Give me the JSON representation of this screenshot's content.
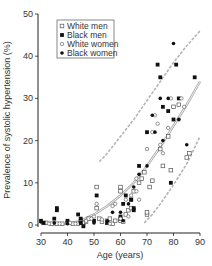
{
  "chart_data": {
    "type": "scatter",
    "title": "",
    "xlabel": "Age (years)",
    "ylabel": "Prevalence of systolic hypertension (%)",
    "xlim": [
      30,
      90
    ],
    "ylim": [
      0,
      50
    ],
    "xticks": [
      30,
      40,
      50,
      60,
      70,
      80,
      90
    ],
    "yticks": [
      0,
      10,
      20,
      30,
      40,
      50
    ],
    "grid": false,
    "legend_position": "upper-left",
    "series": [
      {
        "name": "White men",
        "marker": "open-square",
        "points": [
          [
            31,
            0.5
          ],
          [
            32,
            0.5
          ],
          [
            34,
            0.3
          ],
          [
            36,
            0.3
          ],
          [
            38,
            0.3
          ],
          [
            40,
            0.5
          ],
          [
            42,
            0.3
          ],
          [
            44,
            0.3
          ],
          [
            45,
            1
          ],
          [
            46,
            0.5
          ],
          [
            47,
            0.8
          ],
          [
            48,
            1.5
          ],
          [
            51,
            9
          ],
          [
            51,
            4
          ],
          [
            52,
            1.5
          ],
          [
            53,
            0.8
          ],
          [
            55,
            0.5
          ],
          [
            55,
            1
          ],
          [
            56,
            1.5
          ],
          [
            57,
            0.3
          ],
          [
            58,
            1
          ],
          [
            60,
            9
          ],
          [
            60,
            8
          ],
          [
            60,
            1
          ],
          [
            61,
            0.8
          ],
          [
            62,
            2.5
          ],
          [
            63,
            3.5
          ],
          [
            64,
            4
          ],
          [
            64,
            6
          ],
          [
            65,
            8
          ],
          [
            67,
            10
          ],
          [
            68,
            11
          ],
          [
            69,
            12.5
          ],
          [
            70,
            2.5
          ],
          [
            70,
            3
          ],
          [
            71,
            9
          ],
          [
            72,
            10.5
          ],
          [
            75,
            18
          ],
          [
            76,
            14
          ],
          [
            78,
            21
          ],
          [
            79,
            13
          ],
          [
            80,
            28
          ],
          [
            82,
            28.5
          ],
          [
            85,
            16
          ],
          [
            86,
            17
          ]
        ]
      },
      {
        "name": "Black men",
        "marker": "filled-square",
        "points": [
          [
            30,
            1
          ],
          [
            31,
            0.5
          ],
          [
            35,
            1.5
          ],
          [
            36,
            3.5
          ],
          [
            36,
            4
          ],
          [
            40,
            1
          ],
          [
            44,
            2.5
          ],
          [
            45,
            1.5
          ],
          [
            45,
            0.5
          ],
          [
            46,
            -0.3
          ],
          [
            50,
            1
          ],
          [
            51,
            7
          ],
          [
            55,
            0.5
          ],
          [
            60,
            2
          ],
          [
            60,
            1.5
          ],
          [
            61,
            5
          ],
          [
            62,
            7
          ],
          [
            64,
            6
          ],
          [
            65,
            4
          ],
          [
            65,
            3.5
          ],
          [
            67,
            14
          ],
          [
            70,
            22
          ],
          [
            74,
            38
          ],
          [
            75,
            35
          ],
          [
            76,
            28
          ],
          [
            78,
            27
          ],
          [
            79,
            10
          ],
          [
            80,
            25
          ],
          [
            81,
            38
          ],
          [
            82,
            30
          ],
          [
            88,
            35
          ]
        ]
      },
      {
        "name": "White women",
        "marker": "open-circle",
        "points": [
          [
            33,
            0.3
          ],
          [
            37,
            0.3
          ],
          [
            41,
            0.5
          ],
          [
            43,
            0.3
          ],
          [
            47,
            1
          ],
          [
            49,
            1.5
          ],
          [
            50,
            2
          ],
          [
            51,
            5
          ],
          [
            53,
            1.3
          ],
          [
            56,
            0.3
          ],
          [
            57,
            4.5
          ],
          [
            58,
            5
          ],
          [
            60,
            1.5
          ],
          [
            62,
            6
          ],
          [
            63,
            2
          ],
          [
            64,
            7
          ],
          [
            66,
            8
          ],
          [
            66,
            11
          ],
          [
            67,
            6
          ],
          [
            70,
            18
          ],
          [
            72,
            22
          ],
          [
            73,
            26
          ],
          [
            74,
            24
          ],
          [
            75,
            19
          ],
          [
            76,
            17
          ],
          [
            78,
            23
          ],
          [
            79,
            30
          ],
          [
            82,
            25
          ],
          [
            83,
            30
          ],
          [
            84,
            28
          ]
        ]
      },
      {
        "name": "Black women",
        "marker": "filled-circle",
        "points": [
          [
            30,
            0.7
          ],
          [
            35,
            0.5
          ],
          [
            40,
            0.3
          ],
          [
            45,
            0.5
          ],
          [
            50,
            0.5
          ],
          [
            55,
            1
          ],
          [
            57,
            3
          ],
          [
            60,
            3
          ],
          [
            61,
            1
          ],
          [
            63,
            5
          ],
          [
            65,
            9
          ],
          [
            67,
            12
          ],
          [
            70,
            14
          ],
          [
            72,
            26
          ],
          [
            73,
            22
          ],
          [
            75,
            30
          ],
          [
            76,
            20
          ],
          [
            78,
            30
          ],
          [
            80,
            43
          ],
          [
            82,
            25
          ],
          [
            85,
            19
          ]
        ]
      }
    ],
    "curves": [
      {
        "name": "fit",
        "style": "solid-double",
        "color": "#aaaaaa",
        "points": [
          [
            34,
            0
          ],
          [
            40,
            0.3
          ],
          [
            45,
            1
          ],
          [
            50,
            2.5
          ],
          [
            55,
            4.5
          ],
          [
            60,
            7
          ],
          [
            65,
            10
          ],
          [
            70,
            14
          ],
          [
            75,
            18.5
          ],
          [
            80,
            23.5
          ],
          [
            85,
            28.5
          ],
          [
            90,
            34
          ]
        ]
      },
      {
        "name": "upper-bound",
        "style": "dashed",
        "color": "#b4b4b4",
        "points": [
          [
            52,
            15
          ],
          [
            55,
            17
          ],
          [
            60,
            21
          ],
          [
            65,
            25
          ],
          [
            70,
            29.5
          ],
          [
            75,
            34
          ],
          [
            80,
            38.5
          ],
          [
            85,
            42.5
          ],
          [
            90,
            46
          ]
        ]
      },
      {
        "name": "lower-bound",
        "style": "dashed",
        "color": "#b4b4b4",
        "points": [
          [
            69,
            0.5
          ],
          [
            72,
            2.5
          ],
          [
            75,
            5
          ],
          [
            80,
            9.5
          ],
          [
            85,
            14.5
          ],
          [
            90,
            21
          ]
        ]
      }
    ]
  },
  "legend": {
    "items": [
      {
        "label": "White men",
        "marker": "open-square"
      },
      {
        "label": "Black men",
        "marker": "filled-square"
      },
      {
        "label": "White women",
        "marker": "open-circle"
      },
      {
        "label": "Black women",
        "marker": "filled-circle"
      }
    ]
  },
  "axes": {
    "x_title": "Age (years)",
    "y_title": "Prevalence of systolic hypertension (%)",
    "x_ticks": [
      "30",
      "40",
      "50",
      "60",
      "70",
      "80",
      "90"
    ],
    "y_ticks": [
      "0",
      "10",
      "20",
      "30",
      "40",
      "50"
    ]
  },
  "colors": {
    "marker": "#111111",
    "curve": "#aaaaaa",
    "axis": "#222222"
  }
}
